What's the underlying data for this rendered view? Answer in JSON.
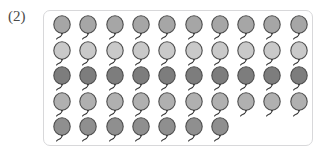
{
  "label": {
    "text": "(2)"
  },
  "panel": {
    "border_color": "#d8d8da",
    "background_color": "#ffffff",
    "corner_radius_px": 7
  },
  "balloon_array": {
    "total_count": 47,
    "columns": 10,
    "rows_count": 5,
    "icon_name": "balloon-icon",
    "outline_color": "#4f4f4f",
    "string_color": "#2b2b2b",
    "rows": [
      {
        "row_index": 1,
        "count": 10,
        "fill_color": "#a6a6a6",
        "shade_name": "medium-gray"
      },
      {
        "row_index": 2,
        "count": 10,
        "fill_color": "#c9c9c9",
        "shade_name": "light-gray"
      },
      {
        "row_index": 3,
        "count": 10,
        "fill_color": "#7d7d7d",
        "shade_name": "dark-gray"
      },
      {
        "row_index": 4,
        "count": 10,
        "fill_color": "#b0b0b0",
        "shade_name": "medium-light-gray"
      },
      {
        "row_index": 5,
        "count": 7,
        "fill_color": "#8f8f8f",
        "shade_name": "medium-dark-gray"
      }
    ]
  },
  "chart_data": {
    "type": "bar",
    "title": "(2)",
    "xlabel": "",
    "ylabel": "",
    "categories": [
      "Row 1",
      "Row 2",
      "Row 3",
      "Row 4",
      "Row 5"
    ],
    "values": [
      10,
      10,
      10,
      10,
      7
    ],
    "ylim": [
      0,
      10
    ],
    "grid": false,
    "legend": "none",
    "annotations": [
      "Pictograph array of balloons; total 47"
    ]
  }
}
